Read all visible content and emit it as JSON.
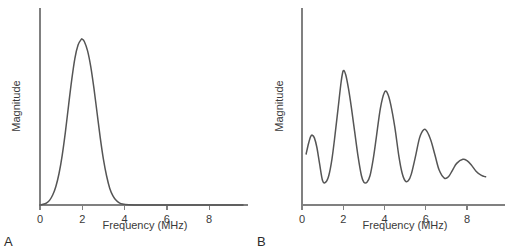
{
  "figure": {
    "background": "#ffffff",
    "curve_color": "#555555",
    "axis_color": "#808080",
    "text_color": "#3a3a3a"
  },
  "panels": [
    {
      "letter": "A",
      "xlabel": "Frequency (MHz)",
      "ylabel": "Magnitude",
      "ticks": [
        "0",
        "2",
        "4",
        "6",
        "8"
      ]
    },
    {
      "letter": "B",
      "xlabel": "Frequency (MHz)",
      "ylabel": "Magnitude",
      "ticks": [
        "0",
        "2",
        "4",
        "6",
        "8"
      ]
    }
  ],
  "chart_data": [
    {
      "type": "line",
      "panel": "A",
      "title": "",
      "xlabel": "Frequency (MHz)",
      "ylabel": "Magnitude",
      "xlim": [
        0,
        9.6
      ],
      "ylim": [
        0,
        1.08
      ],
      "xticks": [
        0,
        2,
        4,
        6,
        8
      ],
      "yticks": [],
      "grid": false,
      "legend": null,
      "description": "Smooth single Gaussian-like spectral peak centered at 2 MHz, returning to baseline by about 4 MHz and flat thereafter.",
      "x": [
        0.0,
        0.15,
        0.3,
        0.45,
        0.6,
        0.75,
        0.9,
        1.05,
        1.2,
        1.35,
        1.5,
        1.65,
        1.8,
        1.95,
        2.0,
        2.1,
        2.25,
        2.4,
        2.55,
        2.7,
        2.85,
        3.0,
        3.15,
        3.3,
        3.45,
        3.6,
        3.75,
        3.9,
        4.2,
        4.8,
        5.6,
        6.5,
        7.5,
        8.5,
        9.6
      ],
      "y": [
        0.0,
        0.004,
        0.012,
        0.028,
        0.06,
        0.112,
        0.19,
        0.3,
        0.44,
        0.6,
        0.755,
        0.885,
        0.965,
        0.999,
        1.0,
        0.985,
        0.93,
        0.835,
        0.705,
        0.555,
        0.405,
        0.275,
        0.175,
        0.1,
        0.055,
        0.028,
        0.013,
        0.006,
        0.002,
        0.0,
        0.0,
        0.0,
        0.0,
        0.0,
        0.0
      ]
    },
    {
      "type": "line",
      "panel": "B",
      "title": "",
      "xlabel": "Frequency (MHz)",
      "ylabel": "Magnitude",
      "xlim": [
        0,
        9.6
      ],
      "ylim": [
        0,
        1.08
      ],
      "xticks": [
        0,
        2,
        4,
        6,
        8
      ],
      "yticks": [],
      "grid": false,
      "legend": null,
      "description": "Damped oscillatory (comb-like) spectrum with local maxima near 0.5, 2.0, 4.0, 5.9 and 7.8 MHz and minima near 1.0, 3.0, 5.0 and 6.9 MHz; peak amplitudes decay with increasing frequency.",
      "peaks_mhz": [
        0.5,
        2.0,
        4.0,
        5.9,
        7.8
      ],
      "peak_values": [
        0.52,
        1.0,
        0.84,
        0.56,
        0.34
      ],
      "troughs_mhz": [
        1.0,
        3.0,
        5.0,
        6.9
      ],
      "trough_values": [
        0.18,
        0.17,
        0.18,
        0.2
      ],
      "x": [
        0.2,
        0.32,
        0.42,
        0.5,
        0.6,
        0.72,
        0.85,
        1.0,
        1.15,
        1.3,
        1.45,
        1.6,
        1.75,
        1.9,
        2.0,
        2.12,
        2.25,
        2.4,
        2.55,
        2.72,
        2.88,
        3.0,
        3.15,
        3.3,
        3.45,
        3.6,
        3.8,
        4.0,
        4.15,
        4.3,
        4.5,
        4.7,
        4.85,
        5.0,
        5.15,
        5.3,
        5.5,
        5.7,
        5.9,
        6.05,
        6.25,
        6.45,
        6.65,
        6.9,
        7.1,
        7.3,
        7.5,
        7.8,
        8.0,
        8.2,
        8.45,
        8.7,
        8.9
      ],
      "y": [
        0.38,
        0.46,
        0.51,
        0.52,
        0.5,
        0.43,
        0.31,
        0.18,
        0.17,
        0.22,
        0.34,
        0.52,
        0.72,
        0.92,
        1.0,
        0.97,
        0.87,
        0.72,
        0.55,
        0.36,
        0.22,
        0.17,
        0.17,
        0.22,
        0.34,
        0.5,
        0.72,
        0.84,
        0.83,
        0.75,
        0.58,
        0.36,
        0.24,
        0.18,
        0.18,
        0.23,
        0.36,
        0.5,
        0.56,
        0.55,
        0.48,
        0.37,
        0.26,
        0.2,
        0.21,
        0.26,
        0.31,
        0.34,
        0.33,
        0.3,
        0.25,
        0.22,
        0.21
      ]
    }
  ]
}
